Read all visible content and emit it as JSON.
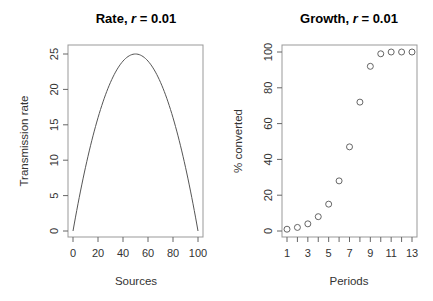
{
  "chart_data": [
    {
      "type": "line",
      "title": "Rate, r = 0.01",
      "title_prefix": "Rate, ",
      "title_var": "r",
      "title_suffix": " = 0.01",
      "xlabel": "Sources",
      "ylabel": "Transmission rate",
      "xlim": [
        0,
        100
      ],
      "ylim": [
        0,
        25
      ],
      "xticks": [
        0,
        20,
        40,
        60,
        80,
        100
      ],
      "yticks": [
        0,
        5,
        10,
        15,
        20,
        25
      ],
      "formula": "0.01 * x * (100 - x)",
      "x": [
        0,
        10,
        20,
        30,
        40,
        50,
        60,
        70,
        80,
        90,
        100
      ],
      "values": [
        0,
        9,
        16,
        21,
        24,
        25,
        24,
        21,
        16,
        9,
        0
      ]
    },
    {
      "type": "scatter",
      "title": "Growth, r = 0.01",
      "title_prefix": "Growth, ",
      "title_var": "r",
      "title_suffix": " = 0.01",
      "xlabel": "Periods",
      "ylabel": "% converted",
      "xlim": [
        1,
        13
      ],
      "ylim": [
        0,
        100
      ],
      "xticks_labeled": [
        1,
        3,
        5,
        7,
        9,
        11,
        13
      ],
      "xticks": [
        1,
        2,
        3,
        4,
        5,
        6,
        7,
        8,
        9,
        10,
        11,
        12,
        13
      ],
      "yticks": [
        0,
        20,
        40,
        60,
        80,
        100
      ],
      "x": [
        1,
        2,
        3,
        4,
        5,
        6,
        7,
        8,
        9,
        10,
        11,
        12,
        13
      ],
      "values": [
        1,
        2,
        4,
        8,
        15,
        28,
        47,
        72,
        92,
        99,
        100,
        100,
        100
      ]
    }
  ]
}
